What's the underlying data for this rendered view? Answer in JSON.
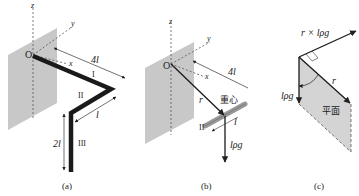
{
  "panels": [
    {
      "caption": "(a)",
      "labels": {
        "z": "z",
        "y": "y",
        "x": "x",
        "origin": "O",
        "len_4l": "4l",
        "seg1": "I",
        "seg2": "II",
        "seg3": "III",
        "len_l": "l",
        "len_2l": "2l"
      }
    },
    {
      "caption": "(b)",
      "labels": {
        "z": "z",
        "y": "y",
        "x": "x",
        "origin": "O",
        "len_4l": "4l",
        "r": "r",
        "center_of_mass": "重心",
        "seg2": "II",
        "len_l": "l",
        "force": "lρg"
      }
    },
    {
      "caption": "(c)",
      "labels": {
        "cross": "r × lρg",
        "r": "r",
        "force": "lρg",
        "plane": "平面"
      }
    }
  ],
  "colors": {
    "plate": "#c8c8c8",
    "rod": "#1a1a1a",
    "line": "#333333",
    "plane": "#d4d4d4"
  }
}
